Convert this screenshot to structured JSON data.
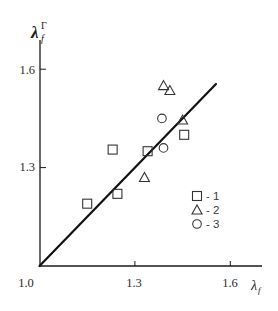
{
  "chart_data": {
    "type": "scatter",
    "title": "",
    "xlabel": "λ_f",
    "ylabel": "λ_f^Γ",
    "xlim": [
      1.0,
      1.6
    ],
    "ylim": [
      1.0,
      1.6
    ],
    "grid": false,
    "legend_position": "lower right (inside plot)",
    "x_ticks": [
      "1.0",
      "1.3",
      "1.6"
    ],
    "y_ticks": [
      "1.3",
      "1.6"
    ],
    "reference_line": {
      "type": "y = x",
      "from": [
        1.0,
        1.0
      ],
      "to": [
        1.555,
        1.555
      ]
    },
    "series": [
      {
        "name": "1",
        "marker": "square",
        "points": [
          {
            "x": 1.15,
            "y": 1.19
          },
          {
            "x": 1.245,
            "y": 1.22
          },
          {
            "x": 1.23,
            "y": 1.355
          },
          {
            "x": 1.34,
            "y": 1.35
          },
          {
            "x": 1.455,
            "y": 1.4
          }
        ]
      },
      {
        "name": "2",
        "marker": "triangle",
        "points": [
          {
            "x": 1.33,
            "y": 1.27
          },
          {
            "x": 1.39,
            "y": 1.55
          },
          {
            "x": 1.41,
            "y": 1.535
          },
          {
            "x": 1.45,
            "y": 1.445
          }
        ]
      },
      {
        "name": "3",
        "marker": "circle",
        "points": [
          {
            "x": 1.385,
            "y": 1.45
          },
          {
            "x": 1.39,
            "y": 1.36
          }
        ]
      }
    ],
    "legend": [
      {
        "marker": "square",
        "label": "- 1"
      },
      {
        "marker": "triangle",
        "label": "- 2"
      },
      {
        "marker": "circle",
        "label": "- 3"
      }
    ]
  },
  "axes": {
    "x_label_main": "λ",
    "x_label_sub": "f",
    "y_label_main": "λ",
    "y_label_sub": "f",
    "y_label_sup": "Γ"
  },
  "colors": {
    "ink": "#1a1a1a",
    "marker_stroke": "#333333",
    "background": "#ffffff"
  }
}
